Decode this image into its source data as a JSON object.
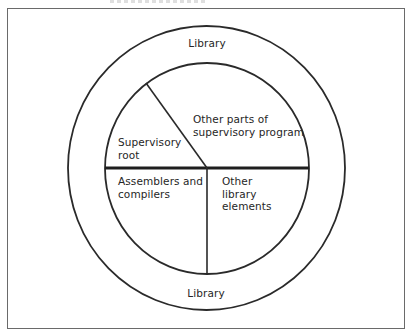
{
  "diagram": {
    "outer_ring": {
      "top_label": "Library",
      "bottom_label": "Library"
    },
    "inner_circle": {
      "sections": [
        {
          "id": "supervisory-root",
          "lines": [
            "Supervisory",
            "root"
          ]
        },
        {
          "id": "other-supervisory",
          "lines": [
            "Other parts of",
            "supervisory program"
          ]
        },
        {
          "id": "assemblers-compilers",
          "lines": [
            "Assemblers and",
            "compilers"
          ]
        },
        {
          "id": "other-library",
          "lines": [
            "Other",
            "library",
            "elements"
          ]
        }
      ]
    },
    "colors": {
      "line": "#2a2a2a",
      "frame": "#6a6a6a",
      "text": "#262626",
      "background": "#ffffff"
    }
  }
}
